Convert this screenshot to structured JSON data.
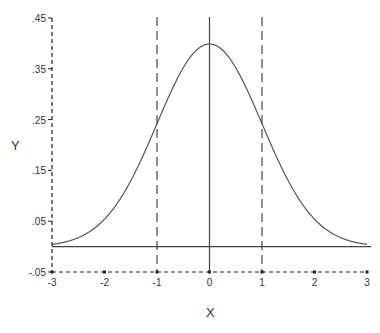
{
  "chart_data": {
    "type": "line",
    "title": "",
    "xlabel": "X",
    "ylabel": "Y",
    "xlim": [
      -3,
      3
    ],
    "ylim": [
      -0.05,
      0.45
    ],
    "x_ticks": [
      -3,
      -2,
      -1,
      0,
      1,
      2,
      3
    ],
    "x_tick_labels": [
      "-3",
      "-2",
      "-1",
      "0",
      "1",
      "2",
      "3"
    ],
    "y_ticks": [
      0.45,
      0.35,
      0.25,
      0.15,
      0.05,
      -0.05
    ],
    "y_tick_labels": [
      ".45",
      ".35",
      ".25",
      ".15",
      ".05",
      "-.05"
    ],
    "grid": false,
    "legend": null,
    "series": [
      {
        "name": "Standard normal density",
        "function": "pdf(x) = exp(-x^2/2)/sqrt(2*pi)",
        "x": [
          -3,
          -2.5,
          -2,
          -1.5,
          -1,
          -0.5,
          0,
          0.5,
          1,
          1.5,
          2,
          2.5,
          3
        ],
        "values": [
          0.0044,
          0.0175,
          0.054,
          0.1295,
          0.242,
          0.3521,
          0.3989,
          0.3521,
          0.242,
          0.1295,
          0.054,
          0.0175,
          0.0044
        ]
      }
    ],
    "reference_lines": [
      {
        "orientation": "horizontal",
        "value": 0,
        "style": "solid"
      },
      {
        "orientation": "vertical",
        "value": 0,
        "style": "solid"
      },
      {
        "orientation": "vertical",
        "value": -1,
        "style": "dashed"
      },
      {
        "orientation": "vertical",
        "value": 1,
        "style": "dashed"
      }
    ],
    "axis_style": "dashed"
  },
  "colors": {
    "curve": "#555555",
    "axes": "#222222",
    "text": "#333333"
  }
}
